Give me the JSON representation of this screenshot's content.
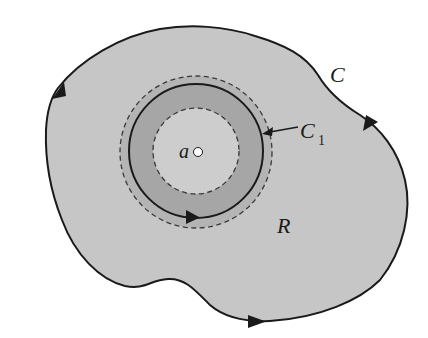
{
  "diagram": {
    "type": "contour-region",
    "colors": {
      "background": "#ffffff",
      "region_fill": "#c6c6c6",
      "outer_ring_fill": "#b4b4b4",
      "inner_ring_fill": "#a6a6a6",
      "inner_disk_fill": "#cdcdcd",
      "stroke": "#1a1a1a",
      "dash_stroke": "#3a3a3a",
      "point_fill": "#ffffff"
    },
    "labels": {
      "outer_curve": "C",
      "inner_circle": "C",
      "inner_circle_subscript": "1",
      "region": "R",
      "point": "a"
    },
    "elements": {
      "outer_curve": {
        "name": "C",
        "orientation": "counterclockwise",
        "arrow_count": 3
      },
      "inner_circle": {
        "name": "C1",
        "center": [
          197,
          152
        ],
        "radius": 67,
        "orientation": "counterclockwise"
      },
      "outer_dashed_circle": {
        "center": [
          197,
          152
        ],
        "radius": 76
      },
      "inner_dashed_circle": {
        "center": [
          197,
          152
        ],
        "radius": 43
      },
      "point_a": {
        "center": [
          198,
          152
        ],
        "radius": 4.5
      }
    }
  }
}
